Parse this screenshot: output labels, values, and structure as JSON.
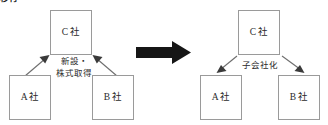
{
  "heading": {
    "fragment": "移行"
  },
  "diagram": {
    "type": "before-after-corporate-structure",
    "transition_arrow": "thick-right-arrow",
    "before": {
      "name": "new-establishment-share-acquisition",
      "label": "新設・株式取得",
      "label_lines": [
        "新設・",
        "株式取得"
      ],
      "direction": "upward",
      "nodes": [
        {
          "id": "c",
          "label": "C 社",
          "position": "top-center"
        },
        {
          "id": "a",
          "label": "A 社",
          "position": "bottom-left"
        },
        {
          "id": "b",
          "label": "B 社",
          "position": "bottom-right"
        }
      ],
      "edges": [
        {
          "from": "a",
          "to": "c"
        },
        {
          "from": "b",
          "to": "c"
        }
      ]
    },
    "after": {
      "name": "subsidiarization",
      "label": "子会社化",
      "label_lines": [
        "子会社化"
      ],
      "direction": "downward",
      "nodes": [
        {
          "id": "c",
          "label": "C 社",
          "position": "top-center"
        },
        {
          "id": "a",
          "label": "A 社",
          "position": "bottom-left"
        },
        {
          "id": "b",
          "label": "B 社",
          "position": "bottom-right"
        }
      ],
      "edges": [
        {
          "from": "c",
          "to": "a"
        },
        {
          "from": "c",
          "to": "b"
        }
      ]
    }
  },
  "colors": {
    "box_border": "#9a9a9a",
    "box_fill": "#ffffff",
    "thin_arrow": "#6e6e6e",
    "thin_arrow_head": "#3a3a3a",
    "big_arrow": "#161616",
    "text": "#2b2b2b",
    "background": "#ffffff"
  }
}
